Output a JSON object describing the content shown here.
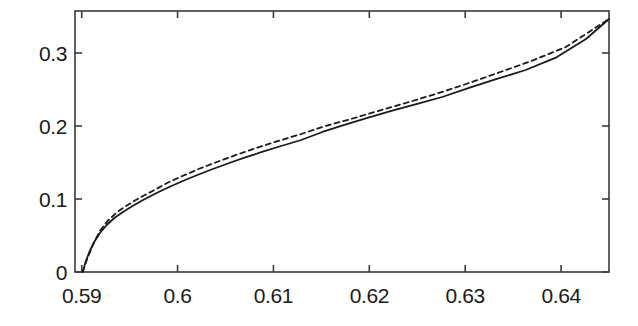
{
  "chart_data": {
    "type": "line",
    "title": "",
    "subtitle": "",
    "xlabel": "",
    "ylabel": "",
    "xlim": [
      0.5893,
      0.645
    ],
    "ylim": [
      0.0,
      0.3575
    ],
    "grid": false,
    "legend": "none",
    "background_color": "#ffffff",
    "axis_color": "#3a3a3a",
    "xticks": [
      0.59,
      0.6,
      0.61,
      0.62,
      0.63,
      0.64
    ],
    "xtick_labels": [
      "0.59",
      "0.6",
      "0.61",
      "0.62",
      "0.63",
      "0.64"
    ],
    "yticks": [
      0,
      0.1,
      0.2,
      0.3
    ],
    "ytick_labels": [
      "0",
      "0.1",
      "0.2",
      "0.3"
    ],
    "series": [
      {
        "name": "solid-curve",
        "style": "solid",
        "color": "#1a1a1a",
        "width": 1.8,
        "x": [
          0.5901,
          0.5904,
          0.5908,
          0.5913,
          0.5919,
          0.5926,
          0.5934,
          0.5943,
          0.5953,
          0.5964,
          0.5976,
          0.5989,
          0.6003,
          0.6018,
          0.6034,
          0.6051,
          0.6069,
          0.6088,
          0.6108,
          0.6129,
          0.6151,
          0.6174,
          0.6198,
          0.6223,
          0.6249,
          0.6276,
          0.6304,
          0.6333,
          0.6363,
          0.6394,
          0.6426,
          0.645
        ],
        "y": [
          0.0,
          0.0137,
          0.0274,
          0.0411,
          0.0534,
          0.0644,
          0.074,
          0.0822,
          0.0904,
          0.0986,
          0.1068,
          0.1151,
          0.1233,
          0.1315,
          0.1397,
          0.1479,
          0.1562,
          0.1644,
          0.1726,
          0.1808,
          0.1918,
          0.2014,
          0.211,
          0.2206,
          0.2301,
          0.2397,
          0.2521,
          0.2644,
          0.2767,
          0.2932,
          0.3192,
          0.3466
        ]
      },
      {
        "name": "dashed-curve",
        "style": "dashed",
        "color": "#1a1a1a",
        "width": 1.8,
        "dash_pattern": "5,4",
        "x": [
          0.5901,
          0.5906,
          0.5912,
          0.5919,
          0.5927,
          0.5937,
          0.5948,
          0.596,
          0.5974,
          0.5989,
          0.6005,
          0.6022,
          0.6041,
          0.6061,
          0.6082,
          0.6105,
          0.6129,
          0.6154,
          0.6181,
          0.6209,
          0.6238,
          0.6269,
          0.6301,
          0.6334,
          0.6369,
          0.6405,
          0.645
        ],
        "y": [
          0.0,
          0.0192,
          0.0384,
          0.0562,
          0.0699,
          0.0822,
          0.0918,
          0.1014,
          0.111,
          0.1219,
          0.1315,
          0.1411,
          0.1507,
          0.1603,
          0.1699,
          0.1795,
          0.189,
          0.2,
          0.2096,
          0.2205,
          0.2315,
          0.2438,
          0.2575,
          0.2726,
          0.289,
          0.3082,
          0.3466
        ]
      }
    ]
  },
  "axes_geometry": {
    "left_px": 75,
    "right_px": 609,
    "top_px": 11,
    "bottom_px": 272
  }
}
